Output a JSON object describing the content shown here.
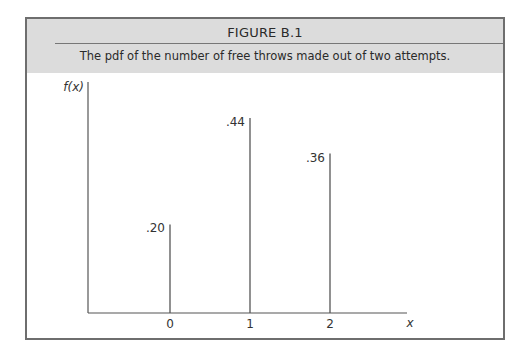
{
  "figure": {
    "label": "FIGURE B.1",
    "caption": "The pdf of the number of free throws made out of two attempts."
  },
  "chart_data": {
    "type": "bar",
    "subtype": "spike/pmf",
    "title": "FIGURE B.1",
    "subtitle": "The pdf of the number of free throws made out of two attempts.",
    "xlabel": "x",
    "ylabel": "f(x)",
    "categories": [
      "0",
      "1",
      "2"
    ],
    "values": [
      0.2,
      0.44,
      0.36
    ],
    "value_labels": [
      ".20",
      ".44",
      ".36"
    ],
    "ylim": [
      0,
      0.5
    ],
    "grid": false,
    "legend": null
  },
  "colors": {
    "header_bg": "#dcdcdc",
    "frame_border": "#6e6e6e",
    "line": "#555555"
  }
}
